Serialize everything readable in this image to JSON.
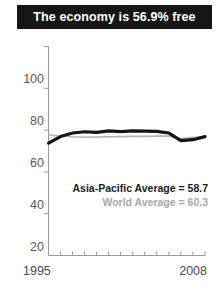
{
  "title": {
    "text": "The economy is 56.9% free"
  },
  "legend": {
    "country_label": "Asia-Pacific Average = 58.7",
    "world_label": "World Average = 60.3"
  },
  "colors": {
    "banner_background": "#161616",
    "banner_text": "#ffffff",
    "country_line": "#151515",
    "world_line": "#b4b4b4",
    "axis": "#9a9a9a",
    "tick_text": "#555555"
  },
  "chart_data": {
    "type": "line",
    "title": "The economy is 56.9% free",
    "xlabel": "",
    "ylabel": "",
    "xlim": [
      1995,
      2008
    ],
    "ylim": [
      0,
      100
    ],
    "yticks": [
      20,
      40,
      60,
      80,
      100
    ],
    "xticks": [
      1995,
      1996,
      1997,
      1998,
      1999,
      2000,
      2001,
      2002,
      2003,
      2004,
      2005,
      2006,
      2007,
      2008
    ],
    "xtick_labels_shown": [
      "1995",
      "2008"
    ],
    "grid": false,
    "legend_position": "inside-right",
    "x": [
      1995,
      1996,
      1997,
      1998,
      1999,
      2000,
      2001,
      2002,
      2003,
      2004,
      2005,
      2006,
      2007,
      2008
    ],
    "series": [
      {
        "name": "Country",
        "annotation": "Asia-Pacific Average = 58.7",
        "color": "#151515",
        "width": 3.2,
        "values": [
          53.8,
          56.9,
          58.6,
          59.2,
          58.9,
          59.6,
          59.3,
          59.6,
          59.5,
          59.4,
          58.6,
          55.0,
          55.4,
          56.9
        ]
      },
      {
        "name": "World Average",
        "annotation": "World Average = 60.3",
        "color": "#b4b4b4",
        "width": 1.6,
        "values": [
          57.6,
          57.2,
          56.8,
          56.6,
          56.7,
          56.8,
          56.9,
          57.0,
          57.0,
          57.1,
          57.1,
          56.0,
          56.6,
          56.8
        ]
      }
    ]
  }
}
